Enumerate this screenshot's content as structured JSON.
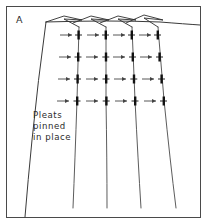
{
  "figure": {
    "panel_label": "A",
    "caption_lines": [
      "Pleats",
      "pinned",
      "in place"
    ],
    "colors": {
      "background": "#ffffff",
      "frame_stroke": "#4a4a4a",
      "fabric_stroke": "#3a3a3a",
      "pin_stroke": "#111111",
      "arrow_stroke": "#444444",
      "text": "#2b2b2b"
    },
    "geometry": {
      "frame": {
        "x": 6,
        "y": 6,
        "width": 195,
        "height": 212
      },
      "waistband_right_edge_y": 24,
      "fabric_left_edge": {
        "top_x": 46,
        "top_y": 22,
        "bottom_x": 25,
        "bottom_y": 212
      },
      "pleat_columns": [
        {
          "name": "pleat-1",
          "top_x": 79,
          "top_y": 27,
          "bottom_x": 73,
          "bottom_y": 208,
          "fold_peak_x": 60,
          "fold_peak_y": 18
        },
        {
          "name": "pleat-2",
          "top_x": 106,
          "top_y": 27,
          "bottom_x": 107,
          "bottom_y": 208,
          "fold_peak_x": 87,
          "fold_peak_y": 18
        },
        {
          "name": "pleat-3",
          "top_x": 132,
          "top_y": 27,
          "bottom_x": 141,
          "bottom_y": 208,
          "fold_peak_x": 113,
          "fold_peak_y": 18
        },
        {
          "name": "pleat-4",
          "top_x": 158,
          "top_y": 27,
          "bottom_x": 175,
          "bottom_y": 208,
          "fold_peak_x": 139,
          "fold_peak_y": 17
        }
      ],
      "pin_rows_y": [
        35,
        57,
        79,
        101
      ],
      "pin_count": 16,
      "pleat_count": 4
    },
    "caption_position": {
      "x": 33,
      "y": 118
    },
    "panel_label_position": {
      "x": 16,
      "y": 20
    }
  }
}
